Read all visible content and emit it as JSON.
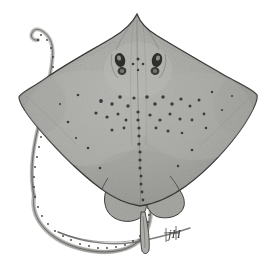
{
  "figure": {
    "kind": "scientific-illustration",
    "view": "dorsal",
    "medium": "pen-and-ink stipple drawing",
    "caption": "",
    "background_color": "#ffffff"
  },
  "colors": {
    "background": "#ffffff",
    "disc_fill": "#a9a9a7",
    "disc_fill_light": "#bdbdba",
    "disc_fill_dark": "#8f8f8c",
    "outline": "#3a3a38",
    "outline_soft": "#5c5c59",
    "thorn": "#3b3b39",
    "eye": "#2b2b29",
    "tail_fill": "#b2b2af",
    "signature": "#4a4a47"
  },
  "anatomy": {
    "parts": [
      {
        "name": "snout",
        "label": "Snout / rostral tip"
      },
      {
        "name": "disc",
        "label": "Pectoral disc"
      },
      {
        "name": "left-wing-tip",
        "label": "Left pectoral wing tip"
      },
      {
        "name": "right-wing-tip",
        "label": "Right pectoral wing tip"
      },
      {
        "name": "left-eye",
        "label": "Left eye"
      },
      {
        "name": "right-eye",
        "label": "Right eye"
      },
      {
        "name": "left-spiracle",
        "label": "Left spiracle"
      },
      {
        "name": "right-spiracle",
        "label": "Right spiracle"
      },
      {
        "name": "midline-thorn-row",
        "label": "Median row of thorns"
      },
      {
        "name": "scapular-thorns",
        "label": "Scapular thorn patches"
      },
      {
        "name": "pelvic-fins",
        "label": "Pelvic fins"
      },
      {
        "name": "claspers",
        "label": "Claspers"
      },
      {
        "name": "tail",
        "label": "Tail"
      },
      {
        "name": "tail-tip",
        "label": "Tail tip"
      }
    ]
  },
  "signature": {
    "text": "jH",
    "position": "lower-right",
    "description": "Artist monogram"
  },
  "geometry": {
    "canvas": {
      "width": 276,
      "height": 261
    },
    "snout": {
      "x": 137,
      "y": 14
    },
    "left_wing_tip": {
      "x": 19,
      "y": 93
    },
    "right_wing_tip": {
      "x": 257,
      "y": 95
    },
    "disc_bottom": {
      "x": 140,
      "y": 205
    },
    "tail_tip": {
      "x": 38,
      "y": 32
    },
    "eye_left": {
      "x": 121,
      "y": 61
    },
    "eye_right": {
      "x": 156,
      "y": 61
    }
  },
  "thorns": {
    "count_visible": 46,
    "description": "Scattered dark dermal thorns over the disc with a median row along the spine"
  }
}
